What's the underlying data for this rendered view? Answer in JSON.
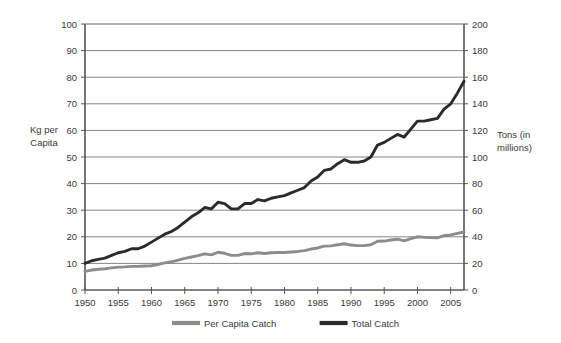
{
  "chart_data": {
    "type": "line",
    "title": "",
    "xlabel": "",
    "ylabel": "Kg per Capita",
    "y2label": "Tons (in millions)",
    "grid": true,
    "legend_position": "bottom",
    "xlim": [
      1950,
      2007
    ],
    "ylim": [
      0,
      100
    ],
    "y2lim": [
      0,
      200
    ],
    "xticks": [
      1950,
      1955,
      1960,
      1965,
      1970,
      1975,
      1980,
      1985,
      1990,
      1995,
      2000,
      2005
    ],
    "xtick_labels": [
      "1950",
      "1955",
      "1960",
      "1965",
      "1970",
      "1975",
      "1980",
      "1985",
      "1990",
      "1995",
      "2000",
      "2005"
    ],
    "yticks": [
      0,
      10,
      20,
      30,
      40,
      50,
      60,
      70,
      80,
      90,
      100
    ],
    "ytick_labels": [
      "0",
      "10",
      "20",
      "30",
      "40",
      "50",
      "60",
      "70",
      "80",
      "90",
      "100"
    ],
    "y2ticks": [
      0,
      20,
      40,
      60,
      80,
      100,
      120,
      140,
      160,
      180,
      200
    ],
    "y2tick_labels": [
      "0",
      "20",
      "40",
      "60",
      "80",
      "100",
      "120",
      "140",
      "160",
      "180",
      "200"
    ],
    "x": [
      1950,
      1951,
      1952,
      1953,
      1954,
      1955,
      1956,
      1957,
      1958,
      1959,
      1960,
      1961,
      1962,
      1963,
      1964,
      1965,
      1966,
      1967,
      1968,
      1969,
      1970,
      1971,
      1972,
      1973,
      1974,
      1975,
      1976,
      1977,
      1978,
      1979,
      1980,
      1981,
      1982,
      1983,
      1984,
      1985,
      1986,
      1987,
      1988,
      1989,
      1990,
      1991,
      1992,
      1993,
      1994,
      1995,
      1996,
      1997,
      1998,
      1999,
      2000,
      2001,
      2002,
      2003,
      2004,
      2005,
      2006,
      2007
    ],
    "series": [
      {
        "name": "Total Catch",
        "axis": "right",
        "units": "million tons",
        "color": "#2b2b2b",
        "values": [
          20,
          22,
          23,
          24,
          26,
          28,
          29,
          31,
          31,
          33,
          36,
          39,
          42,
          44,
          47,
          51,
          55,
          58,
          62,
          61,
          66,
          65,
          61,
          61,
          65,
          65,
          68,
          67,
          69,
          70,
          71,
          73,
          75,
          77,
          82,
          85,
          90,
          91,
          95,
          98,
          96,
          96,
          97,
          100,
          109,
          111,
          114,
          117,
          115,
          121,
          127,
          127,
          128,
          129,
          136,
          140,
          148,
          157
        ]
      },
      {
        "name": "Per Capita Catch",
        "axis": "left",
        "units": "kg",
        "color": "#8c8c8c",
        "values": [
          7.0,
          7.5,
          7.8,
          8.0,
          8.3,
          8.6,
          8.7,
          8.9,
          8.9,
          9.0,
          9.1,
          9.6,
          10.2,
          10.6,
          11.2,
          11.9,
          12.4,
          12.9,
          13.6,
          13.2,
          14.2,
          13.8,
          13.0,
          13.0,
          13.7,
          13.6,
          14.0,
          13.7,
          14.0,
          14.1,
          14.1,
          14.3,
          14.5,
          14.8,
          15.4,
          15.8,
          16.5,
          16.6,
          17.0,
          17.4,
          16.9,
          16.7,
          16.7,
          17.0,
          18.3,
          18.4,
          18.8,
          19.1,
          18.5,
          19.3,
          20.0,
          19.8,
          19.7,
          19.6,
          20.4,
          20.7,
          21.3,
          21.8
        ]
      }
    ],
    "legend": [
      {
        "label": "Per Capita Catch",
        "color": "#8c8c8c"
      },
      {
        "label": "Total Catch",
        "color": "#2b2b2b"
      }
    ],
    "axis_color": "#555555",
    "grid_color": "#666666",
    "background": "#ffffff"
  }
}
